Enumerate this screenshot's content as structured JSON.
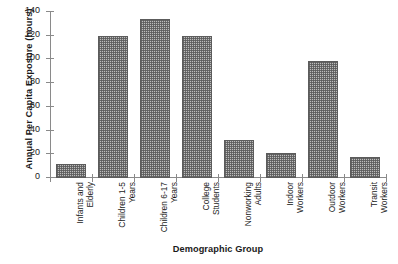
{
  "chart_data": {
    "type": "bar",
    "title": "",
    "xlabel": "Demographic Group",
    "ylabel": "Annual Per Capita Exposure (hours)",
    "categories": [
      "Infants and Elderly",
      "Children 1-5 Years",
      "Children 6-17 Years",
      "College Students",
      "Nonworking Adults",
      "Indoor Workers",
      "Outdoor Workers",
      "Transit Workers"
    ],
    "category_lines": [
      [
        "Infants and",
        "Elderly"
      ],
      [
        "Children 1-5",
        "Years"
      ],
      [
        "Children 6-17",
        "Years"
      ],
      [
        "College",
        "Students"
      ],
      [
        "Nonworking",
        "Adults"
      ],
      [
        "Indoor",
        "Workers"
      ],
      [
        "Outdoor",
        "Workers"
      ],
      [
        "Transit",
        "Workers"
      ]
    ],
    "values": [
      12,
      120,
      134,
      120,
      32,
      21,
      99,
      18
    ],
    "ylim": [
      0,
      140
    ],
    "yticks": [
      0,
      20,
      40,
      60,
      80,
      100,
      120,
      140
    ],
    "ytick_labels": [
      "0",
      "20",
      "40",
      "60",
      "80",
      "100",
      "120",
      "140"
    ],
    "grid": false,
    "legend": null,
    "bar_fill_color": "#bdbdbd",
    "bar_edge_color": "#5c5c5c",
    "axis_color": "#8a8a8a"
  }
}
